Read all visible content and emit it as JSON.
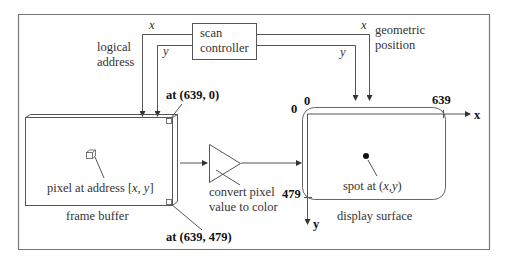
{
  "diagram": {
    "scan_controller": {
      "line1": "scan",
      "line2": "controller"
    },
    "logical_address": {
      "line1": "logical",
      "line2": "address"
    },
    "geometric_position": {
      "line1": "geometric",
      "line2": "position"
    },
    "signals": {
      "x_left": "x",
      "y_left": "y",
      "x_right": "x",
      "y_right": "y"
    },
    "frame_buffer": {
      "label": "frame buffer",
      "pixel_label_prefix": "pixel at address [",
      "pixel_label_xy": "x, y",
      "pixel_label_suffix": "]",
      "top_corner": "at (639, 0)",
      "bottom_corner": "at (639, 479)"
    },
    "converter": {
      "line1": "convert pixel",
      "line2": "value to color"
    },
    "display_surface": {
      "label": "display surface",
      "spot_prefix": "spot at (",
      "spot_xy": "x,y",
      "spot_suffix": ")",
      "origin_x": "0",
      "origin_y": "0",
      "max_x": "639",
      "max_y": "479",
      "axis_x": "x",
      "axis_y": "y"
    }
  }
}
